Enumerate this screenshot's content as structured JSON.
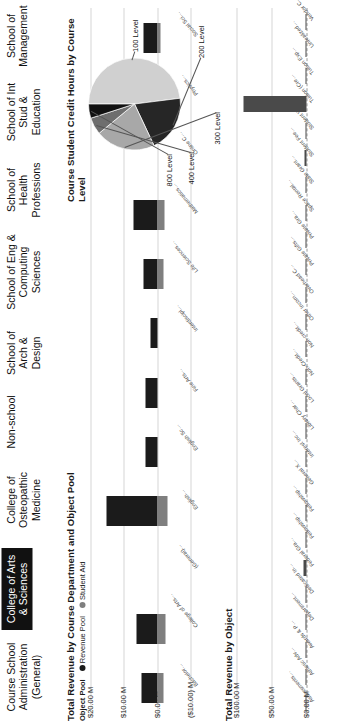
{
  "schools": {
    "items": [
      {
        "label": "Course School Administration (General)",
        "selected": false
      },
      {
        "label": "College of Arts & Sciences",
        "selected": true
      },
      {
        "label": "College of Osteopathic Medicine",
        "selected": false
      },
      {
        "label": "Non-school",
        "selected": false
      },
      {
        "label": "School of Arch & Design",
        "selected": false
      },
      {
        "label": "School of Eng & Computing Sciences",
        "selected": false
      },
      {
        "label": "School of Health Professions",
        "selected": false
      },
      {
        "label": "School of Int Stud & Education",
        "selected": false
      },
      {
        "label": "School of Management",
        "selected": false
      }
    ]
  },
  "chart_data": [
    {
      "id": "revenue_by_department",
      "type": "bar",
      "title": "Total Revenue by Course Department and Object Pool",
      "legend_title": "Object Pool",
      "legend": [
        {
          "label": "Revenue Pool",
          "color": "#1b1b1b"
        },
        {
          "label": "Student Aid",
          "color": "#7f7f7f"
        }
      ],
      "legend_position": "top-left",
      "grid": true,
      "xlabel": "",
      "ylabel": "",
      "ytick_labels": [
        "$20.00 M",
        "$10.00 M",
        "$0.00 M",
        "($10.00) M"
      ],
      "ytick_values": [
        20,
        10,
        0,
        -10
      ],
      "ylim": [
        -10,
        20
      ],
      "categories": [
        "Bachelor…",
        "College of Arts…",
        "(General)…",
        "English…",
        "English Sc…",
        "Fine Arts…",
        "Interdiscipl…",
        "Life Sciences…",
        "Mathematics…",
        "Online C…",
        "Physics…",
        "Social Sci…"
      ],
      "series": [
        {
          "name": "Revenue Pool",
          "color": "#1b1b1b",
          "values": [
            4.6,
            6.2,
            0.0,
            15.2,
            3.4,
            3.6,
            2.1,
            4.2,
            7.0,
            0.0,
            3.8,
            4.1
          ]
        },
        {
          "name": "Student Aid",
          "color": "#7f7f7f",
          "values": [
            -1.9,
            -2.4,
            0.0,
            -3.1,
            0.0,
            0.0,
            0.0,
            -1.8,
            -2.2,
            0.0,
            -0.9,
            -1.0
          ]
        }
      ]
    },
    {
      "id": "credit_hours_by_level",
      "type": "pie",
      "title": "Course Student Credit Hours by Course Level",
      "labels": [
        "100 Level",
        "200 Level",
        "300 Level",
        "400 Level",
        "800 Level"
      ],
      "values": [
        48,
        20,
        21,
        6,
        5
      ],
      "colors": [
        "#d0d0d0",
        "#262626",
        "#a8a8a8",
        "#6e6e6e",
        "#111111"
      ],
      "legend_position": "callout-labels"
    },
    {
      "id": "revenue_by_object",
      "type": "bar",
      "title": "Total Revenue by Object",
      "grid": true,
      "xlabel": "",
      "ylabel": "",
      "ytick_labels": [
        "$100.00 M",
        "$50.00 M",
        "$0.00 M"
      ],
      "ytick_values": [
        100,
        50,
        0
      ],
      "ylim": [
        0,
        100
      ],
      "bar_color": "#4a4a4a",
      "categories": [
        "Assessments…",
        "Athletic Adv…",
        "Awards & P…",
        "Department…",
        "Dedicated In…",
        "Federal Gra…",
        "Fellowship…",
        "Fellowship…",
        "General X…",
        "Interest Inc…",
        "Library Char…",
        "Local Grants…",
        "Non-Credit…",
        "Non-credit…",
        "Other Incom…",
        "Overhead C…",
        "Private Gifts…",
        "Private Gra…",
        "Space Rental…",
        "State Grant…",
        "Student Fee…",
        "Student Wo…",
        "Tuition (Cre…",
        "Tuition Exp…",
        "Unrealized…",
        "Vendor C…"
      ],
      "values": [
        0.4,
        0.2,
        0.1,
        0.3,
        0.2,
        3.6,
        0.2,
        0.2,
        0.3,
        0.2,
        0.1,
        0.2,
        0.5,
        0.3,
        0.6,
        0.4,
        0.8,
        0.4,
        0.2,
        0.3,
        3.1,
        0.2,
        90.0,
        0.3,
        0.2,
        0.1
      ]
    }
  ]
}
